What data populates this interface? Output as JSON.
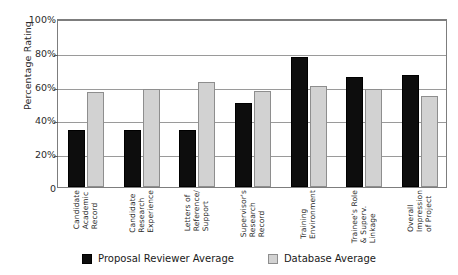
{
  "chart_data": {
    "type": "bar",
    "title": "",
    "xlabel": "",
    "ylabel": "Percentage Rating",
    "ylim": [
      0,
      100
    ],
    "ytick_labels": [
      "100%",
      "80%",
      "60%",
      "40%",
      "20%",
      "0"
    ],
    "ytick_values": [
      100,
      80,
      60,
      40,
      20,
      0
    ],
    "grid": true,
    "legend_position": "bottom",
    "categories": [
      "Candidate Academic Record",
      "Candidate Research Experience",
      "Letters of Reference/ Support",
      "Supervisor's Research Record",
      "Training Environment",
      "Trainee's Role & Superv. Linkage",
      "Overall Impression of Project"
    ],
    "category_lines": [
      [
        "Candidate",
        "Academic",
        "Record"
      ],
      [
        "Candidate",
        "Research",
        "Experience"
      ],
      [
        "Letters of",
        "Reference/",
        "Support"
      ],
      [
        "Supervisor's",
        "Research",
        "Record"
      ],
      [
        "Training",
        "Environment"
      ],
      [
        "Trainee's Role",
        "& Superv.",
        "Linkage"
      ],
      [
        "Overall",
        "Impression",
        "of Project"
      ]
    ],
    "series": [
      {
        "name": "Proposal Reviewer Average",
        "color": "#0d0d0d",
        "values": [
          34,
          34,
          34,
          50,
          77,
          65,
          66
        ]
      },
      {
        "name": "Database Average",
        "color": "#d2d2d2",
        "values": [
          56,
          58,
          62,
          57,
          60,
          58,
          54
        ]
      }
    ]
  },
  "axes": {
    "y_axis_title": "Percentage Rating"
  },
  "legend": {
    "entries": [
      {
        "label": "Proposal Reviewer Average",
        "swatch": "reviewer"
      },
      {
        "label": "Database Average",
        "swatch": "database"
      }
    ]
  }
}
